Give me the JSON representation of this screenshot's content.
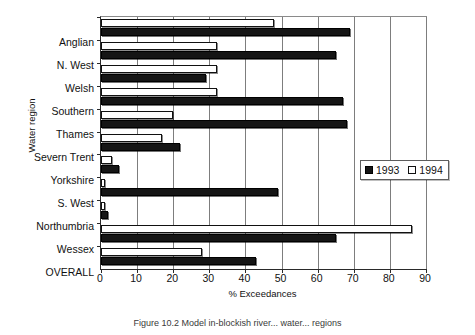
{
  "chart_data": {
    "type": "bar",
    "orientation": "horizontal",
    "title": "",
    "xlabel": "% Exceedances",
    "ylabel": "Water region",
    "xlim": [
      0,
      90
    ],
    "xticks": [
      0,
      10,
      20,
      30,
      40,
      50,
      60,
      70,
      80,
      90
    ],
    "grid": true,
    "legend_position": "center right (inside axes)",
    "categories": [
      "Anglian",
      "N. West",
      "Welsh",
      "Southern",
      "Thames",
      "Severn Trent",
      "Yorkshire",
      "S. West",
      "Northumbria",
      "Wessex",
      "OVERALL"
    ],
    "series": [
      {
        "name": "1993",
        "color": "#151515",
        "values": [
          69,
          65,
          29,
          67,
          68,
          22,
          5,
          49,
          2,
          65,
          43
        ]
      },
      {
        "name": "1994",
        "color": "#ffffff",
        "values": [
          48,
          32,
          32,
          32,
          20,
          17,
          3,
          1,
          1,
          86,
          28
        ]
      }
    ]
  },
  "legend": {
    "items": [
      {
        "label": "1993",
        "swatch": "filled-black-square"
      },
      {
        "label": "1994",
        "swatch": "hollow-white-square"
      }
    ]
  },
  "caption": {
    "text": "Figure 10.2   Model in-blockish river... water... regions"
  }
}
